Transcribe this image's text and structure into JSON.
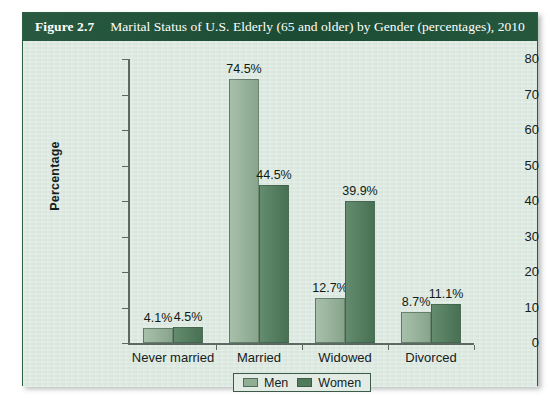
{
  "figure": {
    "number": "Figure 2.7",
    "caption": "Marital Status of U.S. Elderly (65 and older) by Gender (percentages), 2010"
  },
  "colors": {
    "header_green": "#1d5136",
    "panel_background": "#dde9e1",
    "men_bar": "#8fae93",
    "women_bar": "#4e7b5a",
    "axis": "#5a6a63"
  },
  "chart_data": {
    "type": "bar",
    "title": "Marital Status of U.S. Elderly (65 and older) by Gender (percentages), 2010",
    "categories": [
      "Never married",
      "Married",
      "Widowed",
      "Divorced"
    ],
    "series": [
      {
        "name": "Men",
        "values": [
          4.1,
          44.5,
          12.7,
          8.7
        ]
      },
      {
        "name": "Women",
        "values": [
          4.5,
          44.5,
          39.9,
          11.1
        ]
      }
    ],
    "point_labels": {
      "Men": [
        "4.1%",
        "74.5%",
        "12.7%",
        "8.7%"
      ],
      "Women": [
        "4.5%",
        "44.5%",
        "39.9%",
        "11.1%"
      ]
    },
    "men_values_plotted": [
      4.1,
      74.5,
      12.7,
      8.7
    ],
    "women_values_plotted": [
      4.5,
      44.5,
      39.9,
      11.1
    ],
    "xlabel": "",
    "ylabel": "Percentage",
    "ylim": [
      0,
      80
    ],
    "yticks": [
      0,
      10,
      20,
      30,
      40,
      50,
      60,
      70,
      80
    ],
    "ytick_labels": [
      "0",
      "10",
      "20",
      "30",
      "40",
      "50",
      "60",
      "70",
      "80"
    ],
    "grid": false,
    "legend": {
      "position": "bottom-center",
      "entries": [
        "Men",
        "Women"
      ]
    }
  },
  "legend": {
    "men": "Men",
    "women": "Women"
  }
}
